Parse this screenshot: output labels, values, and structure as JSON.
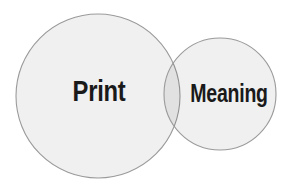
{
  "diagram": {
    "type": "venn",
    "circles": [
      {
        "id": "print",
        "label": "Print",
        "size": "large"
      },
      {
        "id": "meaning",
        "label": "Meaning",
        "size": "small"
      }
    ],
    "overlap": {
      "between": [
        "Print",
        "Meaning"
      ],
      "label": ""
    },
    "colors": {
      "background": "#ffffff",
      "circle_fill": "#f1f1f1",
      "overlap_fill": "#e2e2e2",
      "circle_stroke": "#9a9a9a",
      "label_text": "#1a1a1a"
    }
  }
}
